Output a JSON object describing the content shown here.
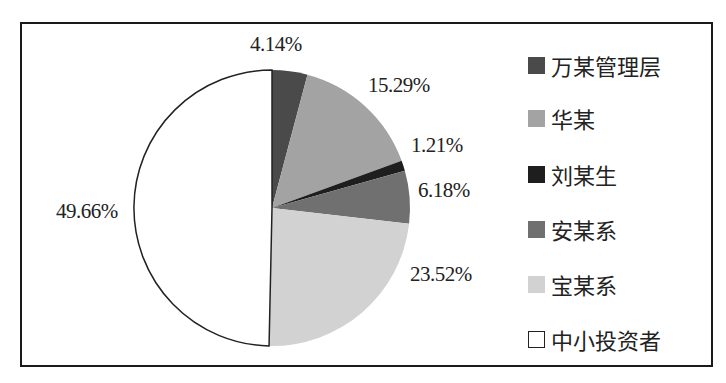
{
  "chart_data": {
    "type": "pie",
    "title": "",
    "start_angle": "12 o'clock, clockwise",
    "categories": [
      "万某管理层",
      "华某",
      "刘某生",
      "安某系",
      "宝某系",
      "中小投资者"
    ],
    "values": [
      4.14,
      15.29,
      1.21,
      6.18,
      23.52,
      49.66
    ],
    "labels": [
      "4.14%",
      "15.29%",
      "1.21%",
      "6.18%",
      "23.52%",
      "49.66%"
    ],
    "colors": [
      "#4a4a4a",
      "#a3a3a3",
      "#1e1e1e",
      "#707070",
      "#d2d2d2",
      "#ffffff"
    ],
    "legend_position": "right",
    "unit": "%"
  },
  "legend": {
    "items": [
      {
        "label": "万某管理层",
        "color": "#4a4a4a"
      },
      {
        "label": "华某",
        "color": "#a3a3a3"
      },
      {
        "label": "刘某生",
        "color": "#1e1e1e"
      },
      {
        "label": "安某系",
        "color": "#707070"
      },
      {
        "label": "宝某系",
        "color": "#d2d2d2"
      },
      {
        "label": "中小投资者",
        "color": "#ffffff"
      }
    ]
  },
  "data_labels": {
    "s0": "4.14%",
    "s1": "15.29%",
    "s2": "1.21%",
    "s3": "6.18%",
    "s4": "23.52%",
    "s5": "49.66%"
  }
}
